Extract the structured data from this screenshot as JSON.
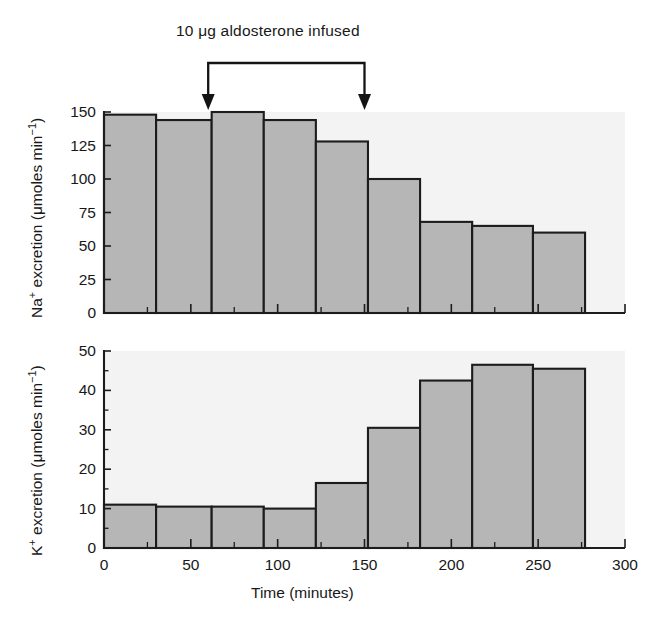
{
  "figure": {
    "annotation": "10 μg aldosterone infused",
    "annotation_arrows": [
      {
        "label": "infusion-start",
        "time": 60
      },
      {
        "label": "infusion-end",
        "time": 150
      }
    ]
  },
  "panels": {
    "top": {
      "ylabel": "Na⁺ excretion (μmoles min⁻¹)",
      "ylabel_parts": {
        "ion": "Na",
        "charge": "+",
        "rest": " excretion (μmoles min",
        "exp": "−1",
        "close": ")"
      },
      "yticks": [
        "0",
        "25",
        "50",
        "75",
        "100",
        "125",
        "150"
      ],
      "ytick_values": [
        0,
        25,
        50,
        75,
        100,
        125,
        150
      ]
    },
    "bottom": {
      "ylabel": "K⁺ excretion (μmoles min⁻¹)",
      "ylabel_parts": {
        "ion": "K",
        "charge": "+",
        "rest": " excretion (μmoles min",
        "exp": "−1",
        "close": ")"
      },
      "yticks": [
        "0",
        "10",
        "20",
        "30",
        "40",
        "50"
      ],
      "ytick_values": [
        0,
        10,
        20,
        30,
        40,
        50
      ],
      "xlabel": "Time (minutes)",
      "xticks": [
        "0",
        "50",
        "100",
        "150",
        "200",
        "250",
        "300"
      ],
      "xtick_values": [
        0,
        50,
        100,
        150,
        200,
        250,
        300
      ]
    }
  },
  "chart_data": [
    {
      "type": "bar",
      "title": "",
      "panel": "top",
      "xlabel": "Time (minutes)",
      "ylabel": "Na+ excretion (μmoles min−1)",
      "xlim": [
        0,
        300
      ],
      "ylim": [
        0,
        150
      ],
      "grid": false,
      "legend": "none",
      "bin_edges": [
        0,
        30,
        62,
        92,
        122,
        152,
        182,
        212,
        247,
        277
      ],
      "categories": [
        "0–30",
        "30–62",
        "62–92",
        "92–122",
        "122–152",
        "152–182",
        "182–212",
        "212–247",
        "247–277"
      ],
      "values": [
        148,
        144,
        150,
        144,
        128,
        100,
        68,
        65,
        60
      ],
      "annotations": [
        {
          "text": "10 μg aldosterone infused",
          "x_start": 60,
          "x_end": 150
        }
      ]
    },
    {
      "type": "bar",
      "title": "",
      "panel": "bottom",
      "xlabel": "Time (minutes)",
      "ylabel": "K+ excretion (μmoles min−1)",
      "xlim": [
        0,
        300
      ],
      "ylim": [
        0,
        50
      ],
      "grid": false,
      "legend": "none",
      "bin_edges": [
        0,
        30,
        62,
        92,
        122,
        152,
        182,
        212,
        247,
        277
      ],
      "categories": [
        "0–30",
        "30–62",
        "62–92",
        "92–122",
        "122–152",
        "152–182",
        "182–212",
        "212–247",
        "247–277"
      ],
      "values": [
        11,
        10.5,
        10.5,
        10,
        16.5,
        30.5,
        42.5,
        46.5,
        45.5
      ]
    }
  ],
  "colors": {
    "bar_fill": "#b6b6b6",
    "bar_edge": "#1c1c1c",
    "plot_background": "#f3f3f3",
    "page_background": "#ffffff",
    "text": "#181818"
  }
}
